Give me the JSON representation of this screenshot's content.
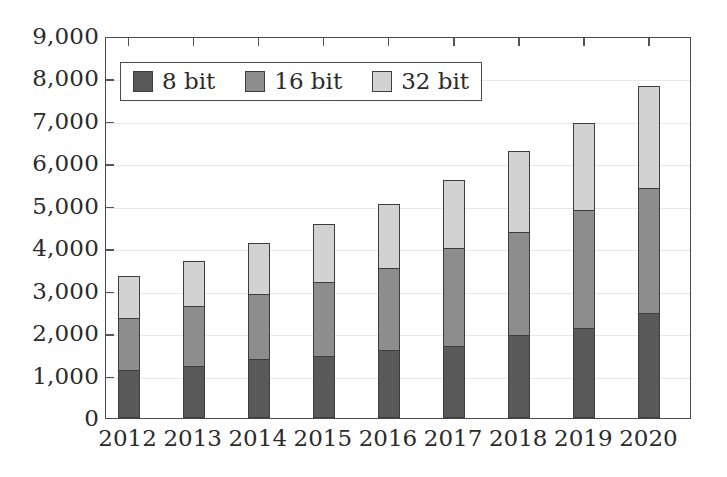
{
  "chart_data": {
    "type": "bar",
    "stacked": true,
    "title": "",
    "subtitle": "",
    "xlabel": "",
    "ylabel": "",
    "categories": [
      "2012",
      "2013",
      "2014",
      "2015",
      "2016",
      "2017",
      "2018",
      "2019",
      "2020"
    ],
    "series": [
      {
        "name": "8 bit",
        "color": "#595959",
        "values": [
          1100,
          1200,
          1350,
          1440,
          1580,
          1670,
          1930,
          2100,
          2450
        ]
      },
      {
        "name": "16 bit",
        "color": "#8d8d8d",
        "values": [
          1220,
          1400,
          1530,
          1740,
          1930,
          2310,
          2430,
          2760,
          2950
        ]
      },
      {
        "name": "32 bit",
        "color": "#d2d2d2",
        "values": [
          1000,
          1070,
          1220,
          1350,
          1510,
          1600,
          1910,
          2070,
          2400
        ]
      }
    ],
    "totals": [
      3320,
      3670,
      4100,
      4530,
      5020,
      5580,
      6270,
      6930,
      7800
    ],
    "ylim": [
      0,
      9000
    ],
    "ytick_values": [
      0,
      1000,
      2000,
      3000,
      4000,
      5000,
      6000,
      7000,
      8000,
      9000
    ],
    "ytick_labels": [
      "0",
      "1,000",
      "2,000",
      "3,000",
      "4,000",
      "5,000",
      "6,000",
      "7,000",
      "8,000",
      "9,000"
    ],
    "grid": true,
    "grid_axis": "y",
    "legend_position": "upper-left-inside",
    "legend_entries": [
      "8 bit",
      "16 bit",
      "32 bit"
    ],
    "frame_color": "#4a4a4a",
    "grid_color": "#e8e8e8",
    "bar_edge_color": "#3d3d3d"
  }
}
